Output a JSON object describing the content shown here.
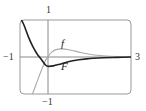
{
  "chart_data": {
    "type": "line",
    "title": "",
    "xlabel": "",
    "ylabel": "",
    "xlim": [
      -1,
      3
    ],
    "ylim": [
      -1,
      1
    ],
    "grid": false,
    "legend": "inline labels",
    "tick_labels": {
      "x_left": "−1",
      "x_right": "3",
      "y_top": "1",
      "y_bottom": "−1"
    },
    "series": [
      {
        "name": "f",
        "color": "#aaaaaa",
        "style": "thin light gray",
        "x": [
          -0.55,
          -0.4,
          -0.25,
          -0.1,
          0,
          0.15,
          0.3,
          0.5,
          0.8,
          1.2,
          1.6,
          2.0,
          2.5,
          3.0
        ],
        "y": [
          -1.0,
          -0.7,
          -0.4,
          -0.12,
          0.0,
          0.14,
          0.2,
          0.22,
          0.19,
          0.12,
          0.06,
          0.03,
          0.01,
          0.0
        ]
      },
      {
        "name": "F",
        "color": "#222222",
        "style": "thick dark",
        "x": [
          -0.95,
          -0.85,
          -0.7,
          -0.55,
          -0.4,
          -0.25,
          -0.1,
          0,
          0.2,
          0.5,
          0.9,
          1.4,
          2.0,
          2.5,
          3.0
        ],
        "y": [
          1.0,
          0.85,
          0.55,
          0.3,
          0.1,
          -0.05,
          -0.2,
          -0.25,
          -0.24,
          -0.18,
          -0.1,
          -0.05,
          -0.02,
          -0.01,
          0.0
        ]
      }
    ],
    "annotations": [
      {
        "text": "f",
        "x": 0.55,
        "y": 0.33
      },
      {
        "text": "F",
        "x": 0.55,
        "y": -0.3
      }
    ]
  }
}
